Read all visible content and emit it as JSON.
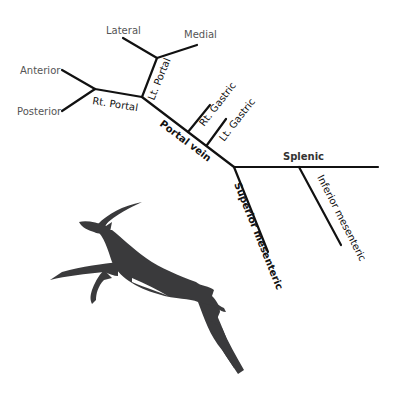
{
  "diagram": {
    "labels": {
      "lateral": "Lateral",
      "medial": "Medial",
      "anterior": "Anterior",
      "posterior": "Posterior",
      "rt_portal": "Rt. Portal",
      "lt_portal": "Lt. Portal",
      "rt_gastric": "Rt. Gastric",
      "lt_gastric": "Lt. Gastric",
      "portal_vein": "Portal vein",
      "splenic": "Splenic",
      "superior_mesenteric": "Superior mesenteric",
      "inferior_mesenteric": "Inferior mesenteric"
    },
    "line_color": "#111111",
    "silhouette": {
      "name": "leaping-antelope",
      "color": "#3a3a3c"
    }
  }
}
